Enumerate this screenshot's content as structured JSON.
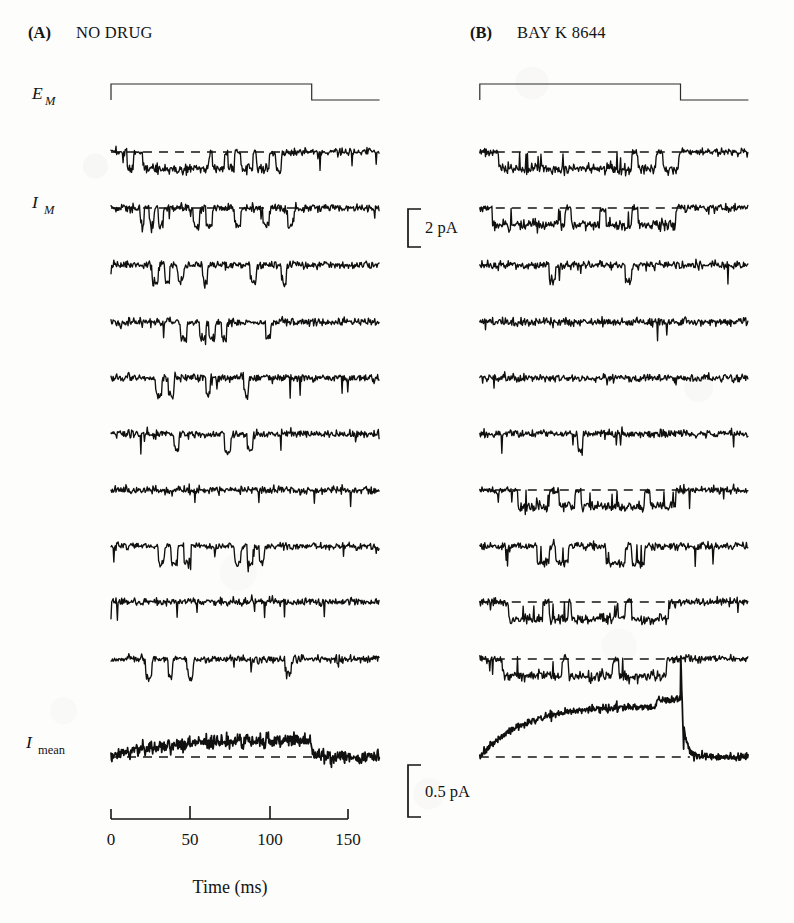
{
  "figure": {
    "type": "single-channel-electrophysiology-recording",
    "background_color": "#fdfdfc",
    "trace_color": "#101010"
  },
  "panels": [
    {
      "id": "A",
      "label": "(A)",
      "title": "NO DRUG",
      "sweep_count": 10
    },
    {
      "id": "B",
      "label": "(B)",
      "title": "BAY K 8644",
      "sweep_count": 10
    }
  ],
  "axis_labels": {
    "voltage": {
      "symbol": "E",
      "subscript": "M",
      "subscript_style": "italic"
    },
    "current": {
      "symbol": "I",
      "subscript": "M",
      "subscript_style": "italic"
    },
    "mean_current": {
      "symbol": "I",
      "subscript": "mean",
      "subscript_style": "roman"
    }
  },
  "scale_bars": [
    {
      "id": "current-scale",
      "label": "2 pA",
      "value": 2,
      "unit": "pA",
      "axis": "current"
    },
    {
      "id": "mean-current-scale",
      "label": "0.5 pA",
      "value": 0.5,
      "unit": "pA",
      "axis": "current"
    }
  ],
  "time_axis": {
    "title": "Time (ms)",
    "unit": "ms",
    "ticks": [
      0,
      50,
      100,
      150
    ],
    "tick_labels": [
      "0",
      "50",
      "100",
      "150"
    ],
    "range": [
      -10,
      160
    ]
  },
  "stimulus": {
    "name": "voltage-step",
    "onset_ms": 0,
    "offset_ms": 127,
    "baseline_level": "holding",
    "step_level": "test"
  },
  "chart_data": {
    "type": "line",
    "xlabel": "Time (ms)",
    "ylabel": "Current",
    "xlim": [
      -10,
      160
    ],
    "grid": false,
    "legend": "none",
    "scale_current_pA": 2,
    "scale_mean_current_pA": 0.5,
    "panels": [
      {
        "name": "NO DRUG",
        "sweeps": [
          {
            "index": 1,
            "dashed_baseline": true,
            "openings": [
              [
                10,
                14
              ],
              [
                20,
                62
              ],
              [
                64,
                72
              ],
              [
                74,
                78
              ],
              [
                82,
                90
              ],
              [
                92,
                100
              ],
              [
                104,
                108
              ]
            ]
          },
          {
            "index": 2,
            "dashed_baseline": true,
            "openings": [
              [
                18,
                21
              ],
              [
                24,
                27
              ],
              [
                30,
                33
              ],
              [
                52,
                56
              ],
              [
                60,
                64
              ],
              [
                78,
                82
              ],
              [
                96,
                100
              ],
              [
                112,
                116
              ]
            ]
          },
          {
            "index": 3,
            "dashed_baseline": false,
            "openings": [
              [
                26,
                30
              ],
              [
                34,
                37
              ],
              [
                42,
                46
              ],
              [
                58,
                61
              ],
              [
                88,
                92
              ],
              [
                108,
                111
              ]
            ]
          },
          {
            "index": 4,
            "dashed_baseline": false,
            "openings": [
              [
                44,
                48
              ],
              [
                56,
                60
              ],
              [
                62,
                66
              ],
              [
                70,
                73
              ],
              [
                98,
                101
              ]
            ]
          },
          {
            "index": 5,
            "dashed_baseline": false,
            "openings": [
              [
                28,
                32
              ],
              [
                36,
                40
              ],
              [
                60,
                63
              ],
              [
                84,
                87
              ]
            ]
          },
          {
            "index": 6,
            "dashed_baseline": false,
            "openings": [
              [
                40,
                43
              ],
              [
                72,
                76
              ],
              [
                86,
                90
              ]
            ]
          },
          {
            "index": 7,
            "dashed_baseline": false,
            "openings": []
          },
          {
            "index": 8,
            "dashed_baseline": false,
            "openings": [
              [
                30,
                34
              ],
              [
                38,
                42
              ],
              [
                46,
                50
              ],
              [
                78,
                82
              ],
              [
                86,
                90
              ],
              [
                94,
                97
              ]
            ]
          },
          {
            "index": 9,
            "dashed_baseline": false,
            "openings": []
          },
          {
            "index": 10,
            "dashed_baseline": false,
            "openings": [
              [
                22,
                26
              ],
              [
                36,
                39
              ],
              [
                48,
                52
              ],
              [
                110,
                114
              ]
            ]
          }
        ],
        "mean_trace": {
          "peak_deflection_pA": -0.22,
          "shape": "shallow-sustained-inward"
        }
      },
      {
        "name": "BAY K 8644",
        "sweeps": [
          {
            "index": 1,
            "dashed_baseline": true,
            "openings": [
              [
                12,
                96
              ],
              [
                100,
                112
              ],
              [
                116,
                126
              ]
            ],
            "long_openings": true
          },
          {
            "index": 2,
            "dashed_baseline": true,
            "openings": [
              [
                8,
                54
              ],
              [
                58,
                76
              ],
              [
                80,
                96
              ],
              [
                100,
                124
              ]
            ],
            "long_openings": true
          },
          {
            "index": 3,
            "dashed_baseline": false,
            "openings": [
              [
                44,
                48
              ],
              [
                92,
                96
              ]
            ]
          },
          {
            "index": 4,
            "dashed_baseline": false,
            "openings": []
          },
          {
            "index": 5,
            "dashed_baseline": false,
            "openings": []
          },
          {
            "index": 6,
            "dashed_baseline": false,
            "openings": [
              [
                62,
                65
              ]
            ]
          },
          {
            "index": 7,
            "dashed_baseline": true,
            "openings": [
              [
                24,
                44
              ],
              [
                50,
                60
              ],
              [
                64,
                104
              ],
              [
                108,
                124
              ]
            ],
            "long_openings": true
          },
          {
            "index": 8,
            "dashed_baseline": false,
            "openings": [
              [
                36,
                44
              ],
              [
                48,
                56
              ],
              [
                80,
                92
              ],
              [
                96,
                104
              ]
            ],
            "long_openings": true
          },
          {
            "index": 9,
            "dashed_baseline": true,
            "openings": [
              [
                18,
                40
              ],
              [
                44,
                56
              ],
              [
                58,
                92
              ],
              [
                96,
                120
              ]
            ],
            "long_openings": true
          },
          {
            "index": 10,
            "dashed_baseline": true,
            "openings": [
              [
                14,
                52
              ],
              [
                56,
                84
              ],
              [
                88,
                118
              ]
            ],
            "long_openings": true
          }
        ],
        "mean_trace": {
          "peak_deflection_pA": -0.95,
          "shape": "large-sustained-inward-with-tail"
        }
      }
    ]
  }
}
